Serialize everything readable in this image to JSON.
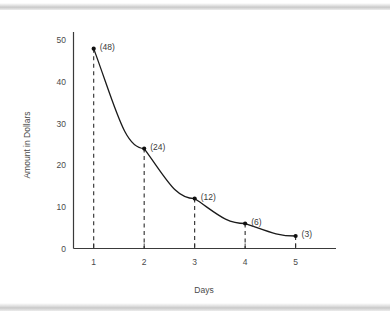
{
  "chart_data": {
    "type": "line",
    "title": "",
    "xlabel": "Days",
    "ylabel": "Amount in Dollars",
    "x": [
      1,
      2,
      3,
      4,
      5
    ],
    "values": [
      48,
      24,
      12,
      6,
      3
    ],
    "point_labels": [
      "(48)",
      "(24)",
      "(12)",
      "(6)",
      "(3)"
    ],
    "xticklabels": [
      "1",
      "2",
      "3",
      "4",
      "5"
    ],
    "yticklabels": [
      "0",
      "10",
      "20",
      "30",
      "40",
      "50"
    ],
    "yticks": [
      0,
      10,
      20,
      30,
      40,
      50
    ],
    "xlim": [
      0.6,
      5.8
    ],
    "ylim": [
      0,
      52
    ],
    "grid": false,
    "legend": false,
    "marker": "filled-circle",
    "dropline_style": "dashed",
    "line_color": "#1a1a1a",
    "axis_color": "#3a3a3a",
    "text_color": "#4a4a4a",
    "background_color": "#ffffff",
    "band_color": "#d0d0d0"
  },
  "figure": {
    "top_band_label": "top-divider-band",
    "bottom_band_label": "bottom-divider-band"
  }
}
